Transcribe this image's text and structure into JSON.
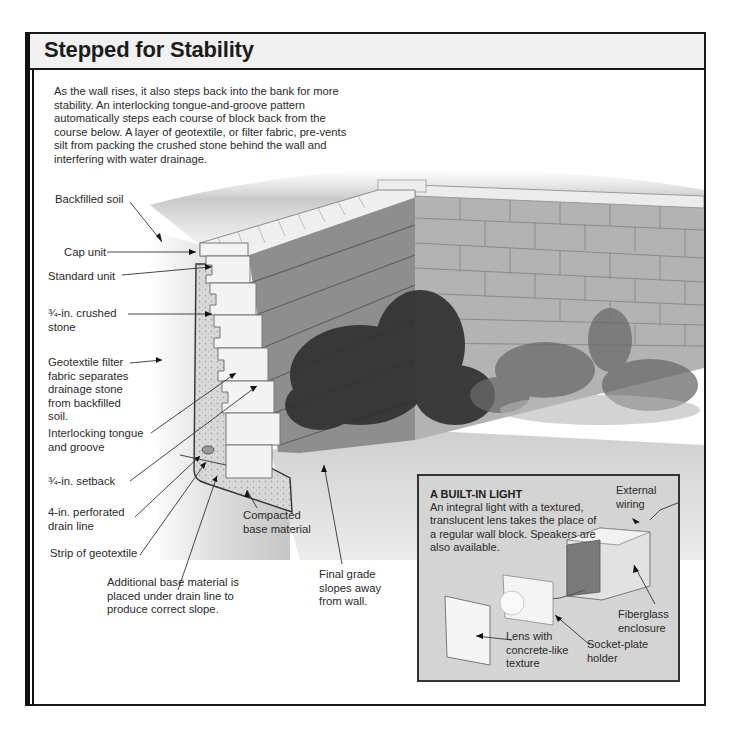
{
  "header": {
    "title": "Stepped for Stability"
  },
  "intro": {
    "text": "As the wall rises, it also steps back into the bank for more stability. An interlocking tongue-and-groove pattern automatically steps each course of block back from the course below. A layer of geotextile, or filter fabric, pre-vents silt from packing the crushed stone behind the wall and interfering with water drainage."
  },
  "labels": {
    "backfilled_soil": "Backfilled soil",
    "cap_unit": "Cap unit",
    "standard_unit": "Standard unit",
    "crushed_stone_1": "¾-in. crushed",
    "crushed_stone_2": "stone",
    "geotextile_1": "Geotextile filter",
    "geotextile_2": "fabric separates",
    "geotextile_3": "drainage stone",
    "geotextile_4": "from backfilled",
    "geotextile_5": "soil.",
    "interlocking_1": "Interlocking tongue",
    "interlocking_2": "and groove",
    "setback": "¾-in. setback",
    "drain_1": "4-in. perforated",
    "drain_2": "drain line",
    "strip": "Strip of geotextile",
    "compacted_1": "Compacted",
    "compacted_2": "base material",
    "additional_1": "Additional base material is",
    "additional_2": "placed under drain line to",
    "additional_3": "produce correct slope.",
    "final_1": "Final grade",
    "final_2": "slopes away",
    "final_3": "from wall."
  },
  "inset": {
    "title": "A BUILT-IN LIGHT",
    "body": "An integral light with a textured, translucent lens takes the place of a regular wall block. Speakers are also available.",
    "labels": {
      "external_1": "External",
      "external_2": "wiring",
      "fiberglass_1": "Fiberglass",
      "fiberglass_2": "enclosure",
      "lens_1": "Lens with",
      "lens_2": "concrete-like",
      "lens_3": "texture",
      "socket_1": "Socket-plate",
      "socket_2": "holder"
    }
  },
  "colors": {
    "frame": "#1a1a1a",
    "title_band": "#f1f1f1",
    "inset_bg": "#d4d4d4",
    "block_face": "#9a9a9a",
    "block_light": "#e8e8e8",
    "foliage": "#2e2e2e"
  }
}
